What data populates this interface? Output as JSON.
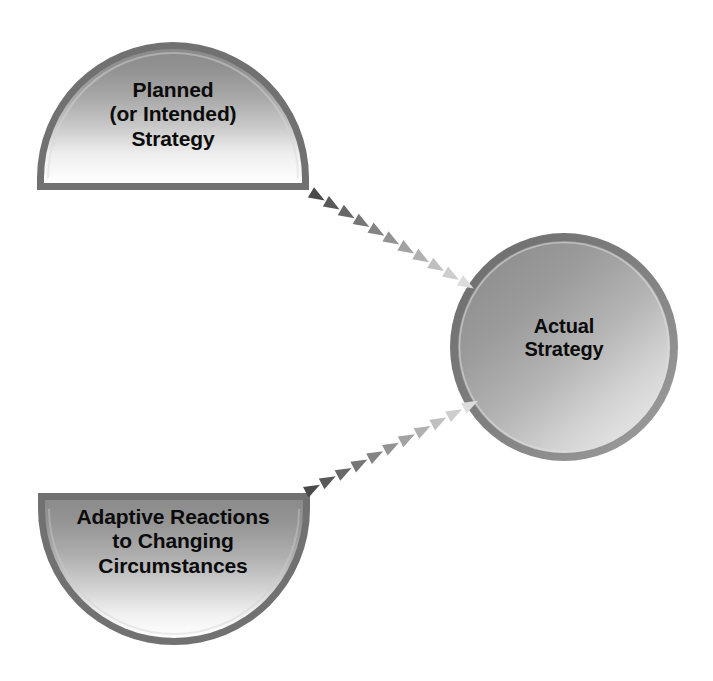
{
  "diagram": {
    "type": "concept-flow",
    "background_color": "#ffffff",
    "nodes": [
      {
        "id": "planned",
        "shape": "semicircle-up",
        "label": "Planned\n(or Intended)\nStrategy",
        "text_color": "#0b0b0b",
        "fill_top_color": "#8c8c8c",
        "fill_bottom_color": "#ffffff",
        "border_color": "#6e6e6e",
        "bounds": {
          "x": 37,
          "y": 42,
          "width": 272,
          "height": 148
        }
      },
      {
        "id": "actual",
        "shape": "circle",
        "label": "Actual\nStrategy",
        "text_color": "#0b0b0b",
        "fill_dark_color": "#8e8e8e",
        "fill_light_color": "#e6e6e6",
        "border_color": "#757575",
        "bounds": {
          "x": 450,
          "y": 232,
          "width": 228,
          "height": 230
        }
      },
      {
        "id": "adaptive",
        "shape": "semicircle-down",
        "label": "Adaptive Reactions\nto Changing\nCircumstances",
        "text_color": "#0b0b0b",
        "fill_top_color": "#8c8c8c",
        "fill_bottom_color": "#ffffff",
        "border_color": "#6e6e6e",
        "bounds": {
          "x": 38,
          "y": 493,
          "width": 270,
          "height": 152
        }
      }
    ],
    "connectors": [
      {
        "id": "planned-to-actual",
        "from": "planned",
        "to": "actual",
        "style": "dashed-triangle-chain",
        "marker_count": 11,
        "start": {
          "x": 317,
          "y": 196
        },
        "end": {
          "x": 466,
          "y": 284
        },
        "color_start": "#4a4a4a",
        "color_end": "#dcdcdc"
      },
      {
        "id": "adaptive-to-actual",
        "from": "adaptive",
        "to": "actual",
        "style": "dashed-triangle-chain",
        "marker_count": 11,
        "start": {
          "x": 312,
          "y": 489
        },
        "end": {
          "x": 470,
          "y": 405
        },
        "color_start": "#4a4a4a",
        "color_end": "#dcdcdc"
      }
    ]
  }
}
